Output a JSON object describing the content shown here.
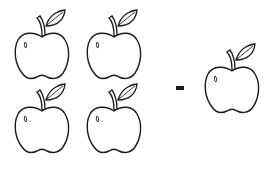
{
  "worksheet": {
    "operation": "-",
    "left_group": {
      "count": 4,
      "items": [
        "apple",
        "apple",
        "apple",
        "apple"
      ]
    },
    "right_group": {
      "count": 1,
      "items": [
        "apple"
      ]
    },
    "icon": "apple-icon",
    "colors": {
      "stroke": "#1a1a1a",
      "fill": "#ffffff"
    }
  }
}
